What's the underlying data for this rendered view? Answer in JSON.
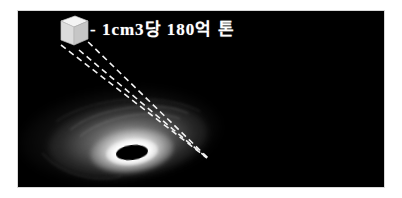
{
  "figure": {
    "background_color": "#ffffff",
    "panel_color": "#000000",
    "annotation_color": "#ffffff"
  },
  "annotation": {
    "label": "- 1cm3당 180억 톤",
    "unit_prefix": "-",
    "volume": "1cm3",
    "per_particle": "당",
    "amount": "180억",
    "unit": "톤",
    "cube_icon": "cube-icon",
    "leader_line_count": 3,
    "leader_line_style": "dashed"
  },
  "scene": {
    "object_name": "black-hole",
    "disk_name": "accretion-disk",
    "core_name": "event-horizon",
    "glow_color": "#ffffff",
    "disk_tint": "#bdbdbd"
  }
}
